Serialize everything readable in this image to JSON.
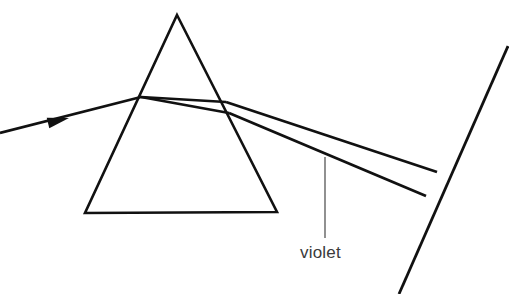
{
  "figure": {
    "kind": "optics-ray-diagram",
    "title_visible": false,
    "background_color": "#ffffff",
    "stroke_color": "#111111",
    "leader_color": "#555555",
    "label_color": "#3a3a3a",
    "width": 509,
    "height": 294
  },
  "labels": {
    "violet": "violet"
  },
  "geometry": {
    "prism": {
      "name": "triangular-prism",
      "apex": [
        177,
        15
      ],
      "base_left": [
        85,
        213
      ],
      "base_right": [
        277,
        212
      ]
    },
    "incident_ray": {
      "name": "incident-white-ray",
      "start": [
        0,
        133
      ],
      "end": [
        141,
        97
      ],
      "arrow_tip": [
        69,
        118
      ],
      "arrow_back": [
        48,
        123
      ]
    },
    "internal_ray_upper": {
      "name": "internal-ray-upper",
      "start": [
        141,
        97
      ],
      "end": [
        226,
        102
      ]
    },
    "internal_ray_lower": {
      "name": "internal-ray-lower",
      "start": [
        141,
        97
      ],
      "end": [
        229,
        113
      ]
    },
    "exit_ray_upper": {
      "name": "exit-ray-upper-red",
      "start": [
        226,
        102
      ],
      "end": [
        437,
        172
      ]
    },
    "exit_ray_lower": {
      "name": "exit-ray-lower-violet",
      "start": [
        229,
        113
      ],
      "end": [
        426,
        196
      ]
    },
    "screen": {
      "name": "screen-line",
      "start": [
        508,
        46
      ],
      "end": [
        399,
        294
      ]
    },
    "leader_line": {
      "name": "violet-leader-line",
      "start": [
        325,
        157
      ],
      "end": [
        325,
        238
      ]
    },
    "label_position": {
      "name": "violet-label-position",
      "x": 300,
      "y": 258
    }
  }
}
